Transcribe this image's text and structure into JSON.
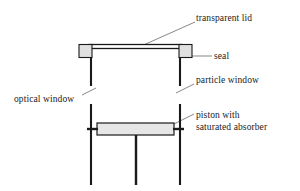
{
  "diagram": {
    "background_color": "#ffffff",
    "line_color": "#1a1a1a",
    "fill_color": "#e0e0e0",
    "leader_color": "#555555",
    "labels": {
      "transparent_lid": "transparent lid",
      "seal": "seal",
      "particle_window": "particle window",
      "optical_window": "optical window",
      "piston_line1": "piston with",
      "piston_line2": "saturated absorber"
    },
    "parts": {
      "lid": "transparent-lid-bar",
      "seal_left": "seal-block-left",
      "seal_right": "seal-block-right",
      "wall_left": "vessel-wall-left",
      "wall_right": "vessel-wall-right",
      "window_left": "optical-window-gap",
      "window_right": "particle-window-gap",
      "piston": "piston-bar",
      "rod": "piston-rod",
      "leg_left": "support-leg-left",
      "leg_right": "support-leg-right"
    }
  }
}
